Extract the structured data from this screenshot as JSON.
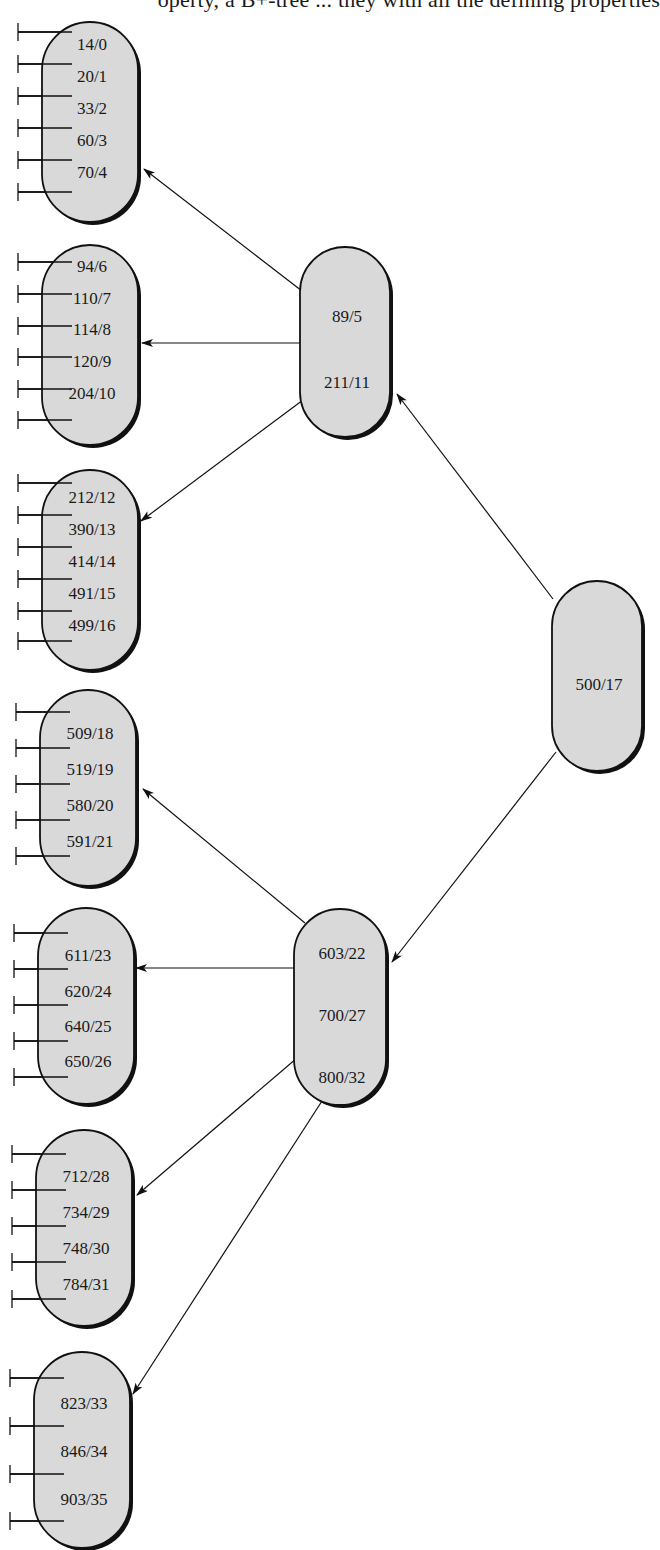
{
  "header_fragment": "operty, a B+-tree ... they with all the defining properties",
  "diagram": {
    "type": "B+-tree index (key/pointer)",
    "root": {
      "id": "root",
      "keys": [
        "500/17"
      ]
    },
    "internal": [
      {
        "id": "internal-left",
        "keys": [
          "89/5",
          "211/11"
        ]
      },
      {
        "id": "internal-right",
        "keys": [
          "603/22",
          "700/27",
          "800/32"
        ]
      }
    ],
    "leaves": [
      {
        "id": "leaf-1",
        "keys": [
          "14/0",
          "20/1",
          "33/2",
          "60/3",
          "70/4"
        ]
      },
      {
        "id": "leaf-2",
        "keys": [
          "94/6",
          "110/7",
          "114/8",
          "120/9",
          "204/10"
        ]
      },
      {
        "id": "leaf-3",
        "keys": [
          "212/12",
          "390/13",
          "414/14",
          "491/15",
          "499/16"
        ]
      },
      {
        "id": "leaf-4",
        "keys": [
          "509/18",
          "519/19",
          "580/20",
          "591/21"
        ]
      },
      {
        "id": "leaf-5",
        "keys": [
          "611/23",
          "620/24",
          "640/25",
          "650/26"
        ]
      },
      {
        "id": "leaf-6",
        "keys": [
          "712/28",
          "734/29",
          "748/30",
          "784/31"
        ]
      },
      {
        "id": "leaf-7",
        "keys": [
          "823/33",
          "846/34",
          "903/35"
        ]
      }
    ],
    "edges": [
      [
        "root",
        "internal-left"
      ],
      [
        "root",
        "internal-right"
      ],
      [
        "internal-left",
        "leaf-1"
      ],
      [
        "internal-left",
        "leaf-2"
      ],
      [
        "internal-left",
        "leaf-3"
      ],
      [
        "internal-right",
        "leaf-4"
      ],
      [
        "internal-right",
        "leaf-5"
      ],
      [
        "internal-right",
        "leaf-6"
      ],
      [
        "internal-right",
        "leaf-7"
      ]
    ],
    "colors": {
      "node_fill": "#d9d9d9",
      "stroke": "#111111",
      "background": "#ffffff"
    }
  }
}
